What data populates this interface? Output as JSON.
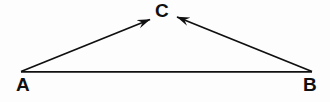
{
  "figure": {
    "type": "vector-triangle-diagram",
    "background_color": "#fdfdfd",
    "stroke_color": "#101010",
    "label_color": "#101010",
    "stroke_width": 1.8,
    "width": 330,
    "height": 102
  },
  "labels": {
    "a": "A",
    "b": "B",
    "c": "C"
  },
  "points": {
    "A": {
      "x": 21,
      "y": 72
    },
    "B": {
      "x": 312,
      "y": 72
    },
    "C": {
      "x": 163,
      "y": 14
    }
  },
  "segments": [
    {
      "name": "vector-a-to-c",
      "from": "A",
      "to": "C",
      "arrowhead_at": "to",
      "x1": 21,
      "y1": 71.5,
      "x2": 150,
      "y2": 19.5
    },
    {
      "name": "vector-b-to-c",
      "from": "B",
      "to": "C",
      "arrowhead_at": "to",
      "x1": 312,
      "y1": 71.5,
      "x2": 177,
      "y2": 17
    },
    {
      "name": "baseline-a-to-b",
      "from": "A",
      "to": "B",
      "arrowhead_at": "none",
      "x1": 21,
      "y1": 71.8,
      "x2": 312,
      "y2": 71.8
    }
  ],
  "arrowhead": {
    "length": 13,
    "half_width": 4
  }
}
